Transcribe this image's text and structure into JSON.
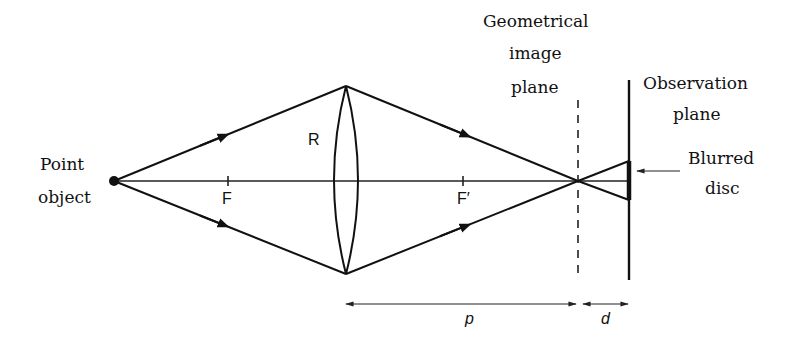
{
  "diagram": {
    "type": "optics ray diagram - defocus blur",
    "colors": {
      "line": "#111111",
      "background": "#ffffff"
    },
    "labels": {
      "point_object_line1": "Point",
      "point_object_line2": "object",
      "focal_point_front": "F",
      "focal_point_back": "F′",
      "lens_radius": "R",
      "geometrical_image_plane_line1": "Geometrical",
      "geometrical_image_plane_line2": "image",
      "geometrical_image_plane_line3": "plane",
      "observation_plane_line1": "Observation",
      "observation_plane_line2": "plane",
      "blurred_disc_line1": "Blurred",
      "blurred_disc_line2": "disc",
      "distance_p": "p",
      "distance_d": "d"
    },
    "nodes": [
      {
        "id": "point-object",
        "x": 114,
        "y": 181
      },
      {
        "id": "focal-point-F",
        "x": 228,
        "y": 181
      },
      {
        "id": "lens-top",
        "x": 346,
        "y": 86
      },
      {
        "id": "lens-bottom",
        "x": 346,
        "y": 274
      },
      {
        "id": "focal-point-F-prime",
        "x": 463,
        "y": 181
      },
      {
        "id": "image-point",
        "x": 578,
        "y": 181
      },
      {
        "id": "blur-top",
        "x": 629,
        "y": 161
      },
      {
        "id": "blur-bottom",
        "x": 629,
        "y": 200
      }
    ],
    "edges": [
      {
        "from": "point-object",
        "to": "lens-top",
        "arrow": "mid"
      },
      {
        "from": "point-object",
        "to": "lens-bottom",
        "arrow": "mid"
      },
      {
        "from": "lens-top",
        "to": "image-point",
        "arrow": "mid"
      },
      {
        "from": "lens-bottom",
        "to": "image-point",
        "arrow": "mid"
      },
      {
        "from": "image-point",
        "to": "blur-top"
      },
      {
        "from": "image-point",
        "to": "blur-bottom"
      },
      {
        "from": "point-object",
        "to": "observation-plane",
        "style": "optical-axis"
      }
    ]
  }
}
